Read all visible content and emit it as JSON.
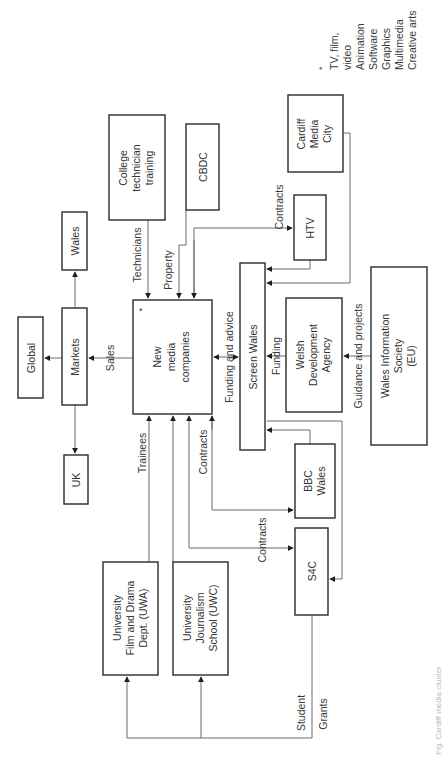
{
  "diagram": {
    "orientation": "rotated -90deg",
    "nodes": {
      "new_media": {
        "lines": [
          "New",
          "media",
          "companies"
        ],
        "marker": "*"
      },
      "markets": {
        "lines": [
          "Markets"
        ]
      },
      "global": {
        "lines": [
          "Global"
        ]
      },
      "wales": {
        "lines": [
          "Wales"
        ]
      },
      "uk": {
        "lines": [
          "UK"
        ]
      },
      "college": {
        "lines": [
          "College",
          "technician",
          "training"
        ]
      },
      "cbdc": {
        "lines": [
          "CBDC"
        ]
      },
      "cardiff_media_city": {
        "lines": [
          "Cardiff",
          "Media",
          "City"
        ]
      },
      "htv": {
        "lines": [
          "HTV"
        ]
      },
      "screen_wales": {
        "lines": [
          "Screen Wales"
        ]
      },
      "wda": {
        "lines": [
          "Welsh",
          "Development",
          "Agency"
        ]
      },
      "wis": {
        "lines": [
          "Wales Information",
          "Society",
          "(EU)"
        ]
      },
      "bbc_wales": {
        "lines": [
          "BBC",
          "Wales"
        ]
      },
      "s4c": {
        "lines": [
          "S4C"
        ]
      },
      "uwa": {
        "lines": [
          "University",
          "Film and Drama",
          "Dept. (UWA)"
        ]
      },
      "uwc": {
        "lines": [
          "University",
          "Journalism",
          "School (UWC)"
        ]
      }
    },
    "edge_labels": {
      "sales": "Sales",
      "technicians": "Technicians",
      "property": "Property",
      "contracts_htv": "Contracts",
      "funding_advice": "Funding and advice",
      "funding": "Funding",
      "guidance": "Guidance and projects",
      "trainees": "Trainees",
      "contracts_bbc": "Contracts",
      "contracts_s4c": "Contracts",
      "student": "Student",
      "grants": "Grants"
    },
    "legend": {
      "marker": "*",
      "lines": [
        "TV, film,",
        "video",
        "Animation",
        "Software",
        "Graphics",
        "Multimedia",
        "Creative arts"
      ]
    },
    "caption": "Fig. Cardiff media cluster"
  }
}
